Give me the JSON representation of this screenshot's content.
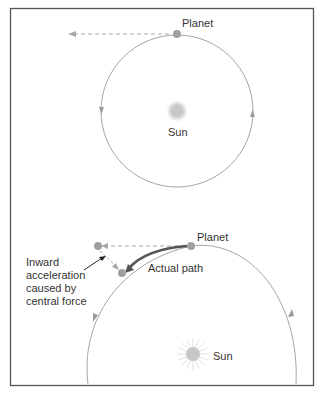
{
  "diagram": {
    "type": "orbital-motion",
    "colors": {
      "frame": "#555555",
      "orbit": "#9a9a9a",
      "planet": "#a0a0a0",
      "sun": "#c8c8c8",
      "actual_path": "#555555",
      "text": "#333333"
    },
    "top_panel": {
      "planet_label": "Planet",
      "sun_label": "Sun"
    },
    "bottom_panel": {
      "planet_label": "Planet",
      "actual_path_label": "Actual path",
      "sun_label": "Sun",
      "inward_label_lines": [
        "Inward",
        "acceleration",
        "caused by",
        "central force"
      ]
    }
  }
}
